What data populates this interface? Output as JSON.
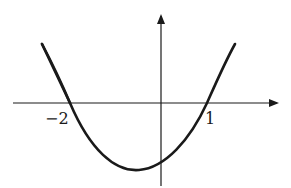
{
  "figure": {
    "type": "parabola-graph",
    "x_axis": {
      "label_ticks": [
        "−2",
        "1"
      ]
    },
    "roots": [
      -2,
      1
    ],
    "colors": {
      "curve": "#1a1a1a",
      "axes": "#1a1a1a",
      "background": "#ffffff"
    }
  },
  "labels": {
    "root_left": "−2",
    "root_right": "1"
  }
}
